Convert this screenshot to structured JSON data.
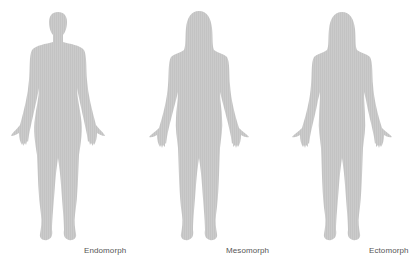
{
  "figures": [
    {
      "id": "endomorph",
      "label": "Endomorph"
    },
    {
      "id": "mesomorph",
      "label": "Mesomorph"
    },
    {
      "id": "ectomorph",
      "label": "Ectomorph"
    }
  ],
  "colors": {
    "background": "#ffffff",
    "silhouette": "#c9c9c9",
    "label": "#555555"
  }
}
